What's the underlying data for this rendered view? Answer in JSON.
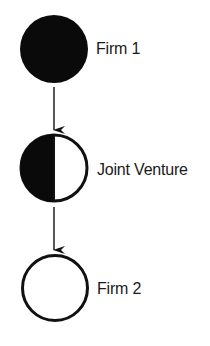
{
  "diagram": {
    "type": "flow",
    "colors": {
      "ink": "#111111",
      "fill_dark": "#0a0a0a",
      "fill_light": "#ffffff",
      "background": "#ffffff"
    },
    "nodes": [
      {
        "id": "firm1",
        "label": "Firm 1",
        "fill": "full-dark"
      },
      {
        "id": "jv",
        "label": "Joint Venture",
        "fill": "half-dark-left"
      },
      {
        "id": "firm2",
        "label": "Firm 2",
        "fill": "empty"
      }
    ],
    "edges": [
      {
        "from": "firm1",
        "to": "jv",
        "style": "arrow-down"
      },
      {
        "from": "jv",
        "to": "firm2",
        "style": "arrow-down"
      }
    ]
  }
}
